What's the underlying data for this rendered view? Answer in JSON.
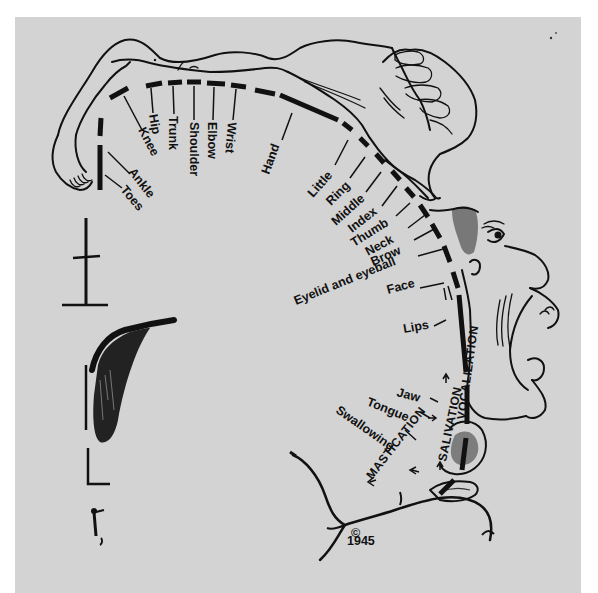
{
  "figure": {
    "background_color": "#d3d3d3",
    "ink_color": "#111111",
    "copyright": {
      "symbol": "©",
      "year": "1945"
    }
  },
  "labels": {
    "toes": "Toes",
    "ankle": "Ankle",
    "knee": "Knee",
    "hip": "Hip",
    "trunk": "Trunk",
    "shoulder": "Shoulder",
    "elbow": "Elbow",
    "wrist": "Wrist",
    "hand": "Hand",
    "little": "Little",
    "ring": "Ring",
    "middle": "Middle",
    "index": "Index",
    "thumb": "Thumb",
    "neck": "Neck",
    "brow": "Brow",
    "eyelid_eyeball": "Eyelid and eyeball",
    "face": "Face",
    "lips": "Lips",
    "jaw": "Jaw",
    "tongue": "Tongue",
    "swallowing": "Swallowing",
    "vocalization": "VOCALIZATION",
    "salivation": "SALIVATION",
    "mastication": "MASTICATION"
  }
}
